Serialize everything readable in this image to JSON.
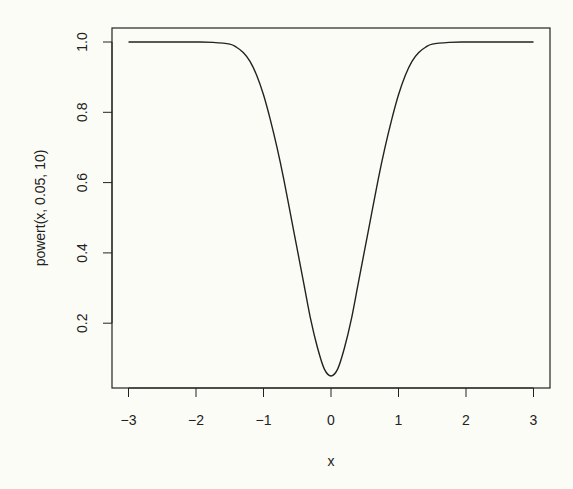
{
  "chart_data": {
    "type": "line",
    "title": "",
    "xlabel": "x",
    "ylabel": "powert(x, 0.05, 10)",
    "xlim": [
      -3,
      3
    ],
    "ylim": [
      0.05,
      1.0
    ],
    "grid": false,
    "legend": null,
    "x_ticks": [
      -3,
      -2,
      -1,
      0,
      1,
      2,
      3
    ],
    "x_tick_labels": [
      "−3",
      "−2",
      "−1",
      "0",
      "1",
      "2",
      "3"
    ],
    "y_ticks": [
      0.2,
      0.4,
      0.6,
      0.8,
      1.0
    ],
    "y_tick_labels": [
      "0.2",
      "0.4",
      "0.6",
      "0.8",
      "1.0"
    ],
    "series": [
      {
        "name": "powert(x, 0.05, 10)",
        "x": [
          -3,
          -2.5,
          -2,
          -1.75,
          -1.5,
          -1.4,
          -1.3,
          -1.2,
          -1.1,
          -1.0,
          -0.9,
          -0.8,
          -0.7,
          -0.6,
          -0.5,
          -0.4,
          -0.3,
          -0.2,
          -0.1,
          0,
          0.1,
          0.2,
          0.3,
          0.4,
          0.5,
          0.6,
          0.7,
          0.8,
          0.9,
          1.0,
          1.1,
          1.2,
          1.3,
          1.4,
          1.5,
          1.75,
          2,
          2.5,
          3
        ],
        "values": [
          1.0,
          1.0,
          1.0,
          0.999,
          0.994,
          0.985,
          0.97,
          0.945,
          0.905,
          0.85,
          0.78,
          0.7,
          0.61,
          0.51,
          0.41,
          0.31,
          0.21,
          0.13,
          0.07,
          0.05,
          0.07,
          0.13,
          0.21,
          0.31,
          0.41,
          0.51,
          0.61,
          0.7,
          0.78,
          0.85,
          0.905,
          0.945,
          0.97,
          0.985,
          0.994,
          0.999,
          1.0,
          1.0,
          1.0
        ]
      }
    ]
  },
  "colors": {
    "background": "#fcfcf7",
    "line": "#222222",
    "axis": "#222222"
  }
}
